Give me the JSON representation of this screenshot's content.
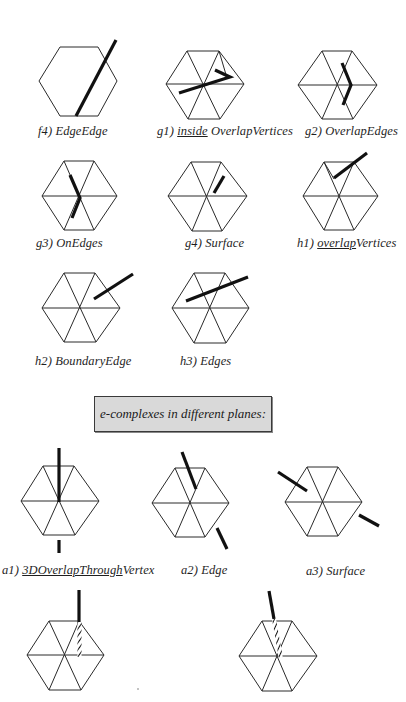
{
  "colors": {
    "background": "#ffffff",
    "hexagon_stroke": "#2a2a2a",
    "segment_stroke": "#111111",
    "banner_fill": "#d9d9d9",
    "banner_border": "#3a3a3a"
  },
  "section_header": {
    "text": "e-complexes  in different planes:"
  },
  "panels": [
    {
      "id": "f4",
      "label_prefix": "f4) ",
      "label_underlined": "",
      "label_suffix": "EdgeEdge",
      "triangulated": false
    },
    {
      "id": "g1",
      "label_prefix": "g1) ",
      "label_underlined": "inside",
      "label_suffix": " OverlapVertices",
      "triangulated": true
    },
    {
      "id": "g2",
      "label_prefix": "g2) ",
      "label_underlined": "",
      "label_suffix": "OverlapEdges",
      "triangulated": true
    },
    {
      "id": "g3",
      "label_prefix": "g3) ",
      "label_underlined": "",
      "label_suffix": "OnEdges",
      "triangulated": true
    },
    {
      "id": "g4",
      "label_prefix": "g4) ",
      "label_underlined": "",
      "label_suffix": "Surface",
      "triangulated": true
    },
    {
      "id": "h1",
      "label_prefix": "h1) ",
      "label_underlined": "overlap",
      "label_suffix": "Vertices",
      "triangulated": true
    },
    {
      "id": "h2",
      "label_prefix": "h2) ",
      "label_underlined": "",
      "label_suffix": "BoundaryEdge",
      "triangulated": true
    },
    {
      "id": "h3",
      "label_prefix": "h3) ",
      "label_underlined": "",
      "label_suffix": "Edges",
      "triangulated": true
    },
    {
      "id": "a1",
      "label_prefix": "a1) ",
      "label_underlined": "3DOverlapThrough",
      "label_suffix": "Vertex",
      "triangulated": true
    },
    {
      "id": "a2",
      "label_prefix": "a2) ",
      "label_underlined": "",
      "label_suffix": "Edge",
      "triangulated": true
    },
    {
      "id": "a3",
      "label_prefix": "a3) ",
      "label_underlined": "",
      "label_suffix": "Surface",
      "triangulated": true
    },
    {
      "id": "a4",
      "label_prefix": "",
      "label_underlined": "",
      "label_suffix": "",
      "triangulated": true
    },
    {
      "id": "a5",
      "label_prefix": "",
      "label_underlined": "",
      "label_suffix": "",
      "triangulated": true
    }
  ]
}
